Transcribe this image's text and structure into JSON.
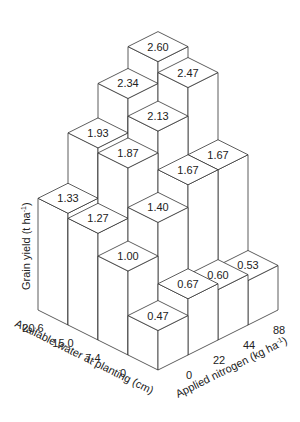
{
  "chart_data": {
    "type": "bar3d",
    "title": "",
    "zlabel": "Grain yield (t ha-1)",
    "xlabel": "Available water at planting (cm)",
    "ylabel": "Applied nitrogen (kg ha-1)",
    "water_levels": [
      "0",
      "7.4",
      "15.0",
      "20.6"
    ],
    "nitrogen_levels": [
      "0",
      "22",
      "44",
      "88"
    ],
    "series": [
      {
        "name": "0",
        "values": [
          0.47,
          0.67,
          0.6,
          0.53
        ]
      },
      {
        "name": "7.4",
        "values": [
          1.0,
          1.4,
          1.67,
          1.67
        ]
      },
      {
        "name": "15.0",
        "values": [
          1.27,
          1.87,
          2.13,
          2.47
        ]
      },
      {
        "name": "20.6",
        "values": [
          1.33,
          1.93,
          2.34,
          2.6
        ]
      }
    ],
    "grid": false,
    "legend": "none"
  },
  "labels": {
    "zaxis": "Grain yield  (t ha",
    "zaxis_sup": "-1",
    "zaxis_end": ")",
    "water_axis": "Available water at planting  (cm)",
    "nitrogen_axis": "Applied nitrogen  (kg ha",
    "nitrogen_sup": "-1",
    "nitrogen_end": ")"
  }
}
